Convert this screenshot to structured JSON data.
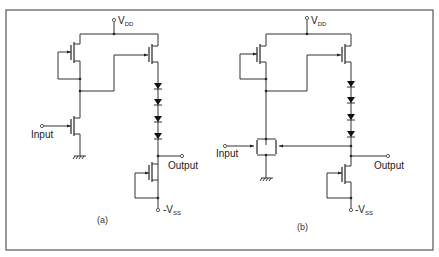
{
  "figure": {
    "type": "circuit-schematic",
    "panels": [
      {
        "id": "a",
        "caption": "(a)",
        "labels": {
          "supply_pos": "V",
          "supply_pos_sub": "DD",
          "supply_neg": "-V",
          "supply_neg_sub": "SS",
          "input": "Input",
          "output": "Output"
        },
        "diode_count": 4
      },
      {
        "id": "b",
        "caption": "(b)",
        "labels": {
          "supply_pos": "V",
          "supply_pos_sub": "DD",
          "supply_neg": "-V",
          "supply_neg_sub": "SS",
          "input": "Input",
          "output": "Output"
        },
        "diode_count": 4
      }
    ]
  }
}
